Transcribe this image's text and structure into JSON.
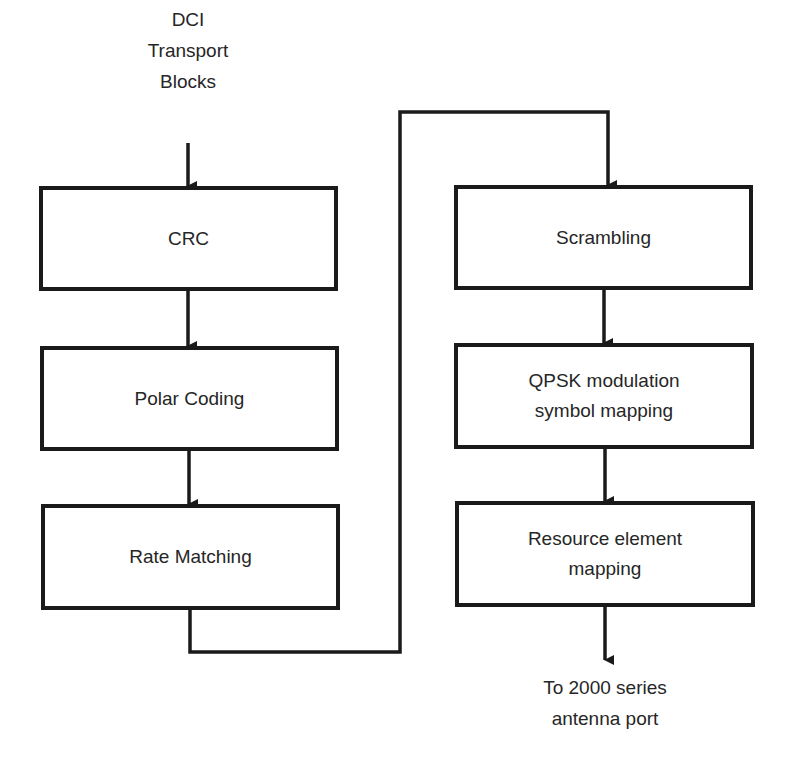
{
  "diagram": {
    "input_label": "DCI\nTransport\nBlocks",
    "output_label": "To 2000 series\nantenna port",
    "left_column": [
      {
        "id": "crc",
        "label": "CRC"
      },
      {
        "id": "polar-coding",
        "label": "Polar Coding"
      },
      {
        "id": "rate-matching",
        "label": "Rate Matching"
      }
    ],
    "right_column": [
      {
        "id": "scrambling",
        "label": "Scrambling"
      },
      {
        "id": "qpsk-modulation",
        "label": "QPSK modulation\nsymbol mapping"
      },
      {
        "id": "resource-element-mapping",
        "label": "Resource element\nmapping"
      }
    ],
    "colors": {
      "stroke": "#1a1a1a",
      "text": "#262626",
      "background": "#ffffff"
    }
  }
}
